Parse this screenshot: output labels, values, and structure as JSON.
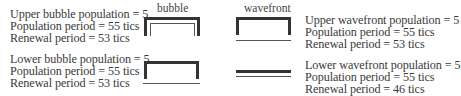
{
  "headers": {
    "bubble": "bubble",
    "wavefront": "wavefront"
  },
  "upper_bubble": [
    "Upper bubble population = 5",
    "Population period = 55 tics",
    "Renewal period = 53 tics"
  ],
  "lower_bubble": [
    "Lower bubble population = 5",
    "Population period = 55 tics",
    "Renewal period = 53 tics"
  ],
  "upper_wavefront": [
    "Upper wavefront population = 5",
    "Population period = 55 tics",
    "Renewal period = 53 tics"
  ],
  "lower_wavefront": [
    "Lower wavefront population = 5",
    "Population period = 55 tics",
    "Renewal period = 46 tics"
  ],
  "colors": {
    "text": "#3a3a3a",
    "thick_line": "#333333",
    "thin_line": "#555555"
  }
}
